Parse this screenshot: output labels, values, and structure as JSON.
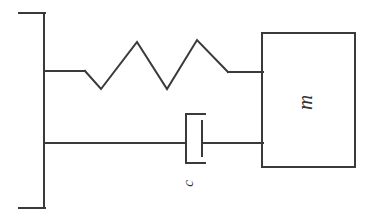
{
  "figure": {
    "background_color": "#ffffff",
    "line_color": "#3a3a3a",
    "width": 373,
    "height": 219
  },
  "labels": {
    "mass": "m",
    "damping": "c"
  },
  "geometry": {
    "wall": {
      "x": 44,
      "top_y": 13,
      "bottom_y": 208,
      "stub_left_x": 19,
      "stub_right_x": 44
    },
    "spring": {
      "attach_y": 71,
      "lead_in_end_x": 85,
      "lead_out_start_x": 228,
      "peak_y": 41,
      "valley_y": 89,
      "vertices": "85,71 101,89 137,42 167,89 197,40 228,72 262,72"
    },
    "damper": {
      "rod_y": 143,
      "cylinder_x": 186,
      "cylinder_top_y": 114,
      "cylinder_bottom_y": 163,
      "cylinder_stub_end_x": 205,
      "piston_x": 202,
      "piston_top_y": 121,
      "piston_bottom_y": 156
    },
    "mass_box": {
      "left": 262,
      "right": 355,
      "top": 33,
      "bottom": 167
    }
  }
}
